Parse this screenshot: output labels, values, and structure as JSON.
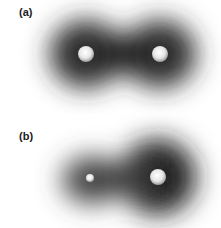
{
  "figure": {
    "panels": [
      {
        "label": "(a)",
        "description": "Symmetric electron density cloud between two identical nuclei (nonpolar bond)",
        "nuclei": [
          {
            "cx": 86,
            "cy": 54,
            "r": 8
          },
          {
            "cx": 160,
            "cy": 54,
            "r": 8
          }
        ]
      },
      {
        "label": "(b)",
        "description": "Asymmetric electron density cloud shifted toward the larger nucleus (polar bond)",
        "nuclei": [
          {
            "cx": 90,
            "cy": 64,
            "r": 4
          },
          {
            "cx": 158,
            "cy": 63,
            "r": 8
          }
        ]
      }
    ],
    "colors": {
      "background": "#ffffff",
      "cloud_core": "#1e1e1e",
      "nucleus_highlight": "#f4f4f4",
      "nucleus_edge": "#9a9a9a",
      "label": "#1a1a1a"
    }
  }
}
